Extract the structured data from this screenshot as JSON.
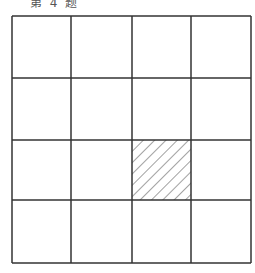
{
  "caption": "第 4 题",
  "diagram": {
    "rows": 4,
    "cols": 4,
    "x_lines": [
      12,
      71,
      132,
      191,
      251
    ],
    "y_lines": [
      16,
      78,
      140,
      200,
      263
    ],
    "shaded_cell": {
      "row": 3,
      "col": 3,
      "pattern": "diagonal-hatch"
    },
    "line_color": "#333333"
  }
}
